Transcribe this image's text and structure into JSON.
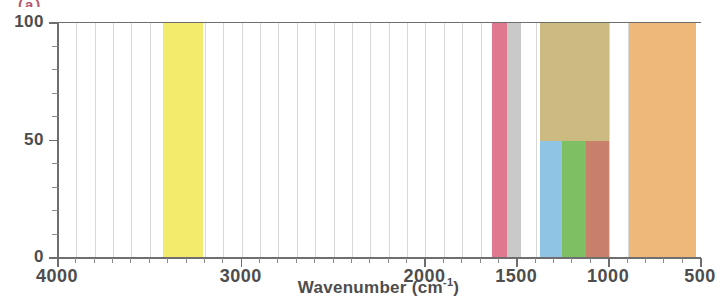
{
  "chart_data": {
    "type": "bar",
    "orientation": "vertical-spans",
    "title": "",
    "subtitle": "",
    "xlabel": "Wavenumber (cm",
    "xlabel_superscript": "-1",
    "xlabel_suffix": ")",
    "xlabel_full": "Wavenumber (cm-1)",
    "ylabel": "",
    "xlim": [
      4000,
      500
    ],
    "ylim": [
      0,
      100
    ],
    "x_reversed": true,
    "grid": true,
    "grid_axis": "x",
    "legend": "none",
    "x_major_ticks": [
      4000,
      3000,
      2000,
      1500,
      1000,
      500
    ],
    "x_major_tick_labels": [
      "4000",
      "3000",
      "2000",
      "1500",
      "1000",
      "500"
    ],
    "x_minor_tick_interval": 100,
    "y_major_ticks": [
      0,
      50,
      100
    ],
    "y_major_tick_labels": [
      "0",
      "50",
      "100"
    ],
    "y_minor_tick_interval": 10,
    "bands": [
      {
        "name": "yellow-band",
        "x_start": 3430,
        "x_end": 3210,
        "value": 100,
        "color": "#F2EB6B"
      },
      {
        "name": "pink-band",
        "x_start": 1640,
        "x_end": 1555,
        "value": 100,
        "color": "#E0788F"
      },
      {
        "name": "gray-band",
        "x_start": 1555,
        "x_end": 1480,
        "value": 100,
        "color": "#C9C9C9"
      },
      {
        "name": "khaki-band",
        "x_start": 1375,
        "x_end": 1000,
        "value": 100,
        "color": "#CBBB80"
      },
      {
        "name": "blue-band",
        "x_start": 1375,
        "x_end": 1255,
        "value": 50,
        "color": "#8FC4E5"
      },
      {
        "name": "green-band",
        "x_start": 1255,
        "x_end": 1128,
        "value": 50,
        "color": "#7FBF63"
      },
      {
        "name": "salmon-band",
        "x_start": 1128,
        "x_end": 1000,
        "value": 50,
        "color": "#C9806B"
      },
      {
        "name": "orange-band",
        "x_start": 890,
        "x_end": 525,
        "value": 100,
        "color": "#EDB878"
      }
    ],
    "gridline_positions": [
      3900,
      3800,
      3700,
      3600,
      3500,
      3400,
      3300,
      3200,
      3100,
      3000,
      2900,
      2800,
      2700,
      2600,
      2500,
      2400,
      2300,
      2200,
      2100,
      2000,
      1900,
      1800,
      1700,
      1600,
      1500,
      1400,
      1300,
      1200,
      1100,
      1000,
      900,
      800,
      700,
      600
    ]
  },
  "artifact": {
    "top_clipped_text": "(a)"
  }
}
